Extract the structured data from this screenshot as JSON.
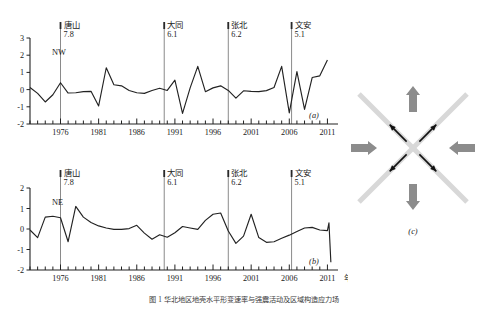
{
  "figure": {
    "caption": "图 1  华北地区地壳水平形变速率与强震活动及区域构造应力场",
    "background_color": "#ffffff",
    "line_color": "#222222",
    "event_line_color": "#8a8a8a",
    "gray_arrow_color": "#8c8c8c",
    "black_arrow_color": "#111111",
    "cross_color": "#d8d8d8"
  },
  "events": [
    {
      "name": "唐山",
      "magnitude": "7.8",
      "year": 1976
    },
    {
      "name": "大同",
      "magnitude": "6.1",
      "year": 1989.6
    },
    {
      "name": "张北",
      "magnitude": "6.2",
      "year": 1998
    },
    {
      "name": "文安",
      "magnitude": "5.1",
      "year": 2006.3
    }
  ],
  "panels": {
    "a": {
      "tag": "(a)",
      "region_label": "NW"
    },
    "b": {
      "tag": "(b)",
      "region_label": "NE",
      "x_axis_unit": "年"
    },
    "c": {
      "tag": "(c)"
    }
  },
  "chart_data": [
    {
      "id": "panel-a",
      "type": "line",
      "title": "",
      "subtitle": "NW",
      "xlabel": "",
      "ylabel": "",
      "xlim": [
        1972,
        2011.6
      ],
      "ylim": [
        -2,
        3
      ],
      "yticks": [
        3,
        2,
        1,
        0,
        -1,
        -2
      ],
      "xticks": [
        1976,
        1981,
        1986,
        1991,
        1996,
        2001,
        2006,
        2011
      ],
      "xtick_labels": [
        "1976",
        "1981",
        "1986",
        "1991",
        "1996",
        "2001",
        "2006",
        "2011"
      ],
      "minor_tick_step": 1,
      "grid": false,
      "legend": "none",
      "x": [
        1972,
        1973,
        1974,
        1975,
        1976,
        1977,
        1978,
        1979,
        1980,
        1981,
        1982,
        1983,
        1984,
        1985,
        1986,
        1987,
        1988,
        1989,
        1990,
        1991,
        1992,
        1993,
        1994,
        1995,
        1996,
        1997,
        1998,
        1999,
        2000,
        2001,
        2002,
        2003,
        2004,
        2005,
        2006,
        2007,
        2008,
        2009,
        2010,
        2011
      ],
      "values": [
        0.12,
        -0.22,
        -0.72,
        -0.3,
        0.4,
        -0.2,
        -0.18,
        -0.12,
        -0.1,
        -0.95,
        1.27,
        0.28,
        0.22,
        -0.05,
        -0.18,
        -0.22,
        -0.05,
        0.08,
        -0.05,
        0.55,
        -1.38,
        0.1,
        1.35,
        -0.12,
        0.1,
        0.22,
        -0.05,
        -0.5,
        -0.07,
        -0.1,
        -0.12,
        -0.06,
        0.12,
        1.35,
        -1.35,
        1.05,
        -1.15,
        0.7,
        0.8,
        1.72
      ],
      "annotations": [
        {
          "label": "唐山 7.8",
          "x": 1976
        },
        {
          "label": "大同 6.1",
          "x": 1989.6
        },
        {
          "label": "张北 6.2",
          "x": 1998
        },
        {
          "label": "文安 5.1",
          "x": 2006.3
        }
      ]
    },
    {
      "id": "panel-b",
      "type": "line",
      "title": "",
      "subtitle": "NE",
      "xlabel": "年",
      "ylabel": "",
      "xlim": [
        1972,
        2011.6
      ],
      "ylim": [
        -2,
        2
      ],
      "yticks": [
        2,
        1,
        0,
        -1,
        -2
      ],
      "xticks": [
        1976,
        1981,
        1986,
        1991,
        1996,
        2001,
        2006,
        2011
      ],
      "xtick_labels": [
        "1976",
        "1981",
        "1986",
        "1991",
        "1996",
        "2001",
        "2006",
        "2011"
      ],
      "minor_tick_step": 1,
      "grid": false,
      "legend": "none",
      "x": [
        1972,
        1973,
        1974,
        1975,
        1976,
        1977,
        1978,
        1979,
        1980,
        1981,
        1982,
        1983,
        1984,
        1985,
        1986,
        1987,
        1988,
        1989,
        1990,
        1991,
        1992,
        1993,
        1994,
        1995,
        1996,
        1997,
        1998,
        1999,
        2000,
        2001,
        2002,
        2003,
        2004,
        2005,
        2006,
        2007,
        2008,
        2009,
        2010,
        2011
      ],
      "values": [
        -0.05,
        -0.42,
        0.58,
        0.62,
        0.55,
        -0.62,
        1.1,
        0.58,
        0.32,
        0.15,
        0.05,
        -0.02,
        -0.02,
        0.02,
        0.18,
        -0.2,
        -0.5,
        -0.28,
        -0.4,
        -0.18,
        0.12,
        0.05,
        -0.02,
        0.42,
        0.72,
        0.78,
        -0.1,
        -0.7,
        -0.35,
        0.72,
        -0.42,
        -0.65,
        -0.62,
        -0.45,
        -0.3,
        -0.12,
        0.05,
        0.08,
        -0.05,
        -0.08
      ],
      "annotations": [
        {
          "label": "唐山 7.8",
          "x": 1976
        },
        {
          "label": "大同 6.1",
          "x": 1989.6
        },
        {
          "label": "张北 6.2",
          "x": 1998
        },
        {
          "label": "文安 5.1",
          "x": 2006.3
        }
      ],
      "tail_x": [
        2011,
        2011.2,
        2011.45
      ],
      "tail_values": [
        -0.08,
        0.3,
        -1.62
      ]
    },
    {
      "id": "panel-c",
      "type": "diagram",
      "title": "",
      "description": "regional tectonic stress field: horizontal compression (inward gray arrows), vertical extension (outward gray arrows), diagonal conjugate shear (black arrows) over an X-shaped fault cross",
      "arrows": [
        {
          "name": "compression-left",
          "direction": "east",
          "color": "#8c8c8c",
          "style": "thick"
        },
        {
          "name": "compression-right",
          "direction": "west",
          "color": "#8c8c8c",
          "style": "thick"
        },
        {
          "name": "extension-up",
          "direction": "north",
          "color": "#8c8c8c",
          "style": "thick"
        },
        {
          "name": "extension-down",
          "direction": "south",
          "color": "#8c8c8c",
          "style": "thick"
        },
        {
          "name": "shear-ne",
          "direction": "northeast",
          "color": "#111111",
          "style": "thin"
        },
        {
          "name": "shear-nw",
          "direction": "northwest",
          "color": "#111111",
          "style": "thin"
        },
        {
          "name": "shear-se",
          "direction": "southeast",
          "color": "#111111",
          "style": "thin"
        },
        {
          "name": "shear-sw",
          "direction": "southwest",
          "color": "#111111",
          "style": "thin"
        }
      ]
    }
  ]
}
